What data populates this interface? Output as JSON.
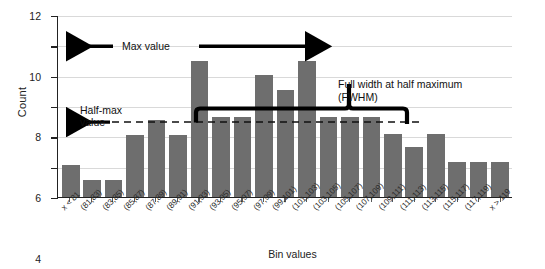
{
  "chart_data": {
    "type": "bar",
    "title": "",
    "subtitle": "",
    "xlabel": "Bin values",
    "ylabel": "Count",
    "ylim": [
      0,
      12
    ],
    "yticks": [
      0,
      2,
      4,
      6,
      8,
      10,
      12
    ],
    "grid": true,
    "legend": "none",
    "bar_color": "#6e6e6e",
    "categories": [
      "x < 81",
      "(81,83)",
      "(83,85)",
      "(85,87)",
      "(87,89)",
      "(89,91)",
      "(91,93)",
      "(93,95)",
      "(95,97)",
      "(97,99)",
      "(99,101)",
      "(101,103)",
      "(103,105)",
      "(105,107)",
      "(107,109)",
      "(109,111)",
      "(111,113)",
      "(113,115)",
      "(115,117)",
      "(117,119)",
      "x > 119"
    ],
    "values": [
      2.1,
      1.1,
      1.1,
      4.1,
      5.1,
      4.1,
      9.0,
      5.3,
      5.3,
      8.1,
      7.1,
      9.0,
      5.3,
      5.3,
      5.3,
      4.2,
      3.3,
      4.2,
      2.3,
      2.3,
      2.3
    ],
    "annotations": {
      "max_value": "Max value",
      "half_max_line1": "Half-max",
      "half_max_line2": "value",
      "fwhm_line1": "Full width at half maximum",
      "fwhm_line2": "(FWHM)",
      "max_level": 10,
      "half_max_level": 5
    }
  },
  "axis": {
    "y_tick_labels": [
      "12",
      "10",
      "8",
      "6",
      "4",
      "2",
      "0"
    ],
    "y_title": "Count",
    "x_title": "Bin values"
  }
}
